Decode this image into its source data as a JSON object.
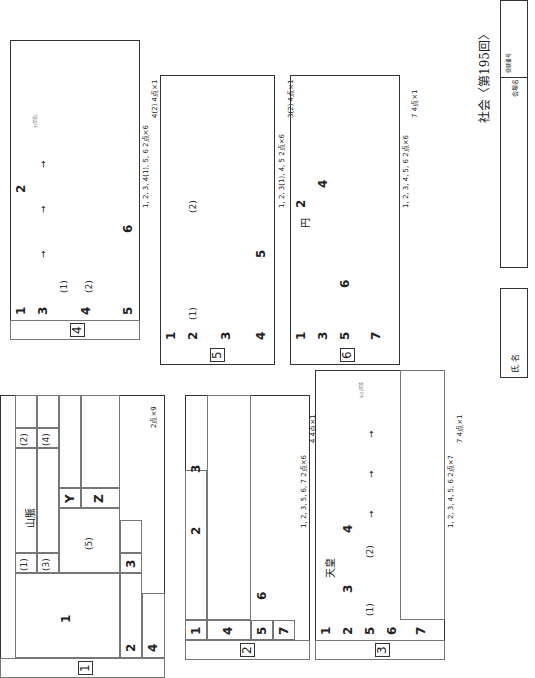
{
  "title": "社会〈第195回〉",
  "sections": {
    "s1": {
      "no": "1",
      "q1": "1",
      "q2": "2",
      "q3": "3",
      "q4": "4",
      "p1": "(1)",
      "p2": "(2)",
      "p3": "(3)",
      "p4": "(4)",
      "p5": "(5)",
      "y": "Y",
      "z": "Z",
      "text": "山脈",
      "points": "2点×9"
    },
    "s2": {
      "no": "2",
      "q1": "1",
      "q2": "2",
      "q3": "3",
      "q4": "4",
      "q5": "5",
      "q6": "6",
      "q7": "7",
      "points_a": "1, 2, 3, 5, 6, 7  2点×6",
      "points_b": "4  4点×1"
    },
    "s3": {
      "no": "3",
      "q1": "1",
      "q2": "2",
      "q3": "3",
      "q4": "4",
      "q5": "5",
      "q6": "6",
      "q7": "7",
      "p1": "(1)",
      "p2": "(2)",
      "text": "天皇",
      "arrow": "→",
      "note": "5(2)完答",
      "points_a": "1, 2, 3, 4, 5, 6  2点×7",
      "points_b": "7  4点×1"
    },
    "s4": {
      "no": "4",
      "q1": "1",
      "q2": "2",
      "q3": "3",
      "q4": "4",
      "q5": "5",
      "q6": "6",
      "p1": "(1)",
      "p2": "(2)",
      "arrow": "→",
      "note": "3(完答)",
      "points_a": "1, 2, 3, 4(1), 5, 6  2点×6",
      "points_b": "4(2)  4点×1"
    },
    "s5": {
      "no": "5",
      "q1": "1",
      "q2": "2",
      "q3": "3",
      "q4": "4",
      "q5": "5",
      "p1": "(1)",
      "p2": "(2)",
      "points_a": "1, 2, 3(1), 4, 5  2点×6",
      "points_b": "3(2)  4点×1"
    },
    "s6": {
      "no": "6",
      "q1": "1",
      "q2": "2",
      "q3": "3",
      "q4": "4",
      "q5": "5",
      "q6": "6",
      "q7": "7",
      "text": "円",
      "points_a": "1, 2, 3, 4, 5, 6  2点×6",
      "points_b": "7  4点×1"
    }
  },
  "footer": {
    "name_label": "氏 名",
    "venue_label": "会場名",
    "exam_no_label": "受験番号"
  }
}
